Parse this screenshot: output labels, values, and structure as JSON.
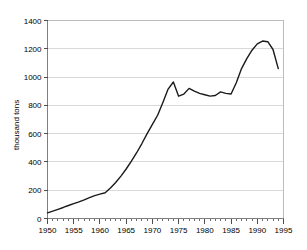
{
  "chart_data": {
    "type": "line",
    "title": "",
    "subtitle": "",
    "xlabel": "",
    "ylabel": "thousand tons",
    "xlim": [
      1950,
      1995
    ],
    "ylim": [
      0,
      1400
    ],
    "grid": true,
    "legend": false,
    "legend_position": "none",
    "x_tick_labels": [
      "1950",
      "1955",
      "1960",
      "1965",
      "1970",
      "1975",
      "1980",
      "1985",
      "1990",
      "1995"
    ],
    "x_tick_values": [
      1950,
      1955,
      1960,
      1965,
      1970,
      1975,
      1980,
      1985,
      1990,
      1995
    ],
    "x_minor_tick_step": 1,
    "y_tick_labels": [
      "0",
      "200",
      "400",
      "600",
      "800",
      "1000",
      "1200",
      "1400"
    ],
    "y_tick_values": [
      0,
      200,
      400,
      600,
      800,
      1000,
      1200,
      1400
    ],
    "series": [
      {
        "name": "thousand tons",
        "color": "#1a1a1a",
        "x": [
          1950,
          1951,
          1952,
          1953,
          1954,
          1955,
          1956,
          1957,
          1958,
          1959,
          1960,
          1961,
          1962,
          1963,
          1964,
          1965,
          1966,
          1967,
          1968,
          1969,
          1970,
          1971,
          1972,
          1973,
          1974,
          1975,
          1976,
          1977,
          1978,
          1979,
          1980,
          1981,
          1982,
          1983,
          1984,
          1985,
          1986,
          1987,
          1988,
          1989,
          1990,
          1991,
          1992,
          1993,
          1994
        ],
        "values": [
          40,
          52,
          65,
          78,
          92,
          105,
          118,
          132,
          148,
          162,
          172,
          182,
          215,
          255,
          300,
          350,
          405,
          465,
          530,
          600,
          665,
          730,
          820,
          915,
          965,
          865,
          880,
          920,
          900,
          885,
          875,
          865,
          870,
          895,
          885,
          880,
          960,
          1060,
          1130,
          1190,
          1235,
          1255,
          1250,
          1195,
          1060
        ],
        "annotations": []
      }
    ]
  }
}
